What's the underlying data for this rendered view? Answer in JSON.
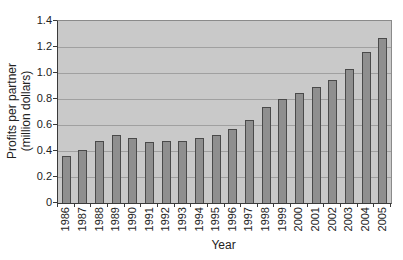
{
  "chart_data": {
    "type": "bar",
    "title": "",
    "xlabel": "Year",
    "ylabel_line1": "Profits per partner",
    "ylabel_line2": "(million dollars)",
    "categories": [
      "1986",
      "1987",
      "1988",
      "1989",
      "1990",
      "1991",
      "1992",
      "1993",
      "1994",
      "1995",
      "1996",
      "1997",
      "1998",
      "1999",
      "2000",
      "2001",
      "2002",
      "2003",
      "2004",
      "2005"
    ],
    "values": [
      0.36,
      0.41,
      0.48,
      0.52,
      0.5,
      0.47,
      0.48,
      0.48,
      0.5,
      0.52,
      0.57,
      0.64,
      0.74,
      0.8,
      0.85,
      0.89,
      0.95,
      1.03,
      1.16,
      1.27
    ],
    "ylim": [
      0,
      1.4
    ],
    "ytick_step": 0.2,
    "yticks": [
      "0",
      "0.2",
      "0.4",
      "0.6",
      "0.8",
      "1.0",
      "1.2",
      "1.4"
    ],
    "grid": true,
    "legend": "none",
    "colors": {
      "page_bg": "#ffffff",
      "plot_bg": "#c9c9c9",
      "gridline": "#a0a0a0",
      "bar_fill": "#8f8f8f",
      "bar_border": "#4a4a4a",
      "axis": "#3a3a3a",
      "text": "#222222"
    }
  }
}
